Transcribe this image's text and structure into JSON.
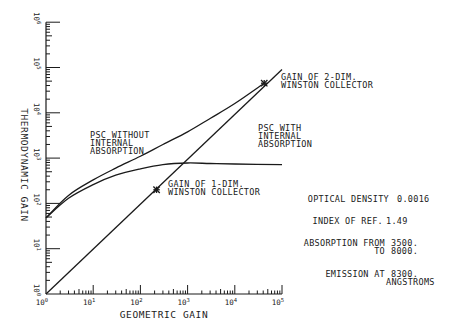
{
  "chart_data": {
    "type": "line",
    "title": "",
    "xlabel": "GEOMETRIC GAIN",
    "ylabel": "THERMODYNAMIC GAIN",
    "xscale": "log",
    "yscale": "log",
    "xlim": [
      1,
      100000
    ],
    "ylim": [
      1,
      1000000
    ],
    "x_tick_labels": [
      "10^0",
      "10^1",
      "10^2",
      "10^3",
      "10^4",
      "10^5"
    ],
    "y_tick_labels": [
      "10^0",
      "10^1",
      "10^2",
      "10^3",
      "10^4",
      "10^5",
      "10^6"
    ],
    "grid": false,
    "series": [
      {
        "name": "PSC WITHOUT INTERNAL ABSORPTION",
        "x": [
          1,
          3,
          10,
          30,
          100,
          300,
          1000,
          3000,
          10000,
          42000
        ],
        "y": [
          48,
          150,
          330,
          600,
          1100,
          2000,
          3800,
          7500,
          16000,
          45000
        ]
      },
      {
        "name": "PSC WITH INTERNAL ABSORPTION",
        "x": [
          1,
          3,
          10,
          30,
          100,
          300,
          1000,
          3000,
          10000,
          100000
        ],
        "y": [
          48,
          130,
          260,
          420,
          580,
          720,
          780,
          760,
          740,
          720
        ]
      },
      {
        "name": "GAIN OF WINSTON COLLECTOR (IDEAL)",
        "x": [
          1,
          100000
        ],
        "y": [
          1,
          90000
        ]
      }
    ],
    "markers": [
      {
        "label": "GAIN OF 1-DIM. WINSTON COLLECTOR",
        "x": 220,
        "y": 200
      },
      {
        "label": "GAIN OF 2-DIM. WINSTON COLLECTOR",
        "x": 42000,
        "y": 45000
      }
    ],
    "annotations": [
      {
        "lines": [
          "PSC WITHOUT",
          "INTERNAL",
          "ABSORPTION"
        ]
      },
      {
        "lines": [
          "PSC WITH",
          "INTERNAL",
          "ABSORPTION"
        ]
      },
      {
        "lines": [
          "GAIN OF 1-DIM.",
          "WINSTON COLLECTOR"
        ]
      },
      {
        "lines": [
          "GAIN OF 2-DIM.",
          "WINSTON COLLECTOR"
        ]
      }
    ],
    "parameters": {
      "optical_density_label": "OPTICAL DENSITY",
      "optical_density_value": "0.0016",
      "index_label": "INDEX OF REF.",
      "index_value": "1.49",
      "absorption_label": "ABSORPTION FROM",
      "absorption_from": "3500.",
      "absorption_to_label": "TO",
      "absorption_to": "8000.",
      "emission_label": "EMISSION AT",
      "emission_value": "8300.",
      "emission_unit": "ANGSTROMS"
    }
  }
}
